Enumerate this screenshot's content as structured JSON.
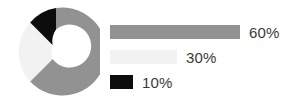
{
  "chart_data": {
    "type": "pie",
    "variant": "donut",
    "title": "",
    "subtitle": "",
    "xlabel": "",
    "ylabel": "",
    "grid": false,
    "legend_position": "right",
    "start_angle_deg": 0,
    "direction": "clockwise",
    "inner_radius_ratio": 0.52,
    "labels": [
      "60%",
      "30%",
      "10%"
    ],
    "values": [
      60,
      30,
      10
    ],
    "value_suffix": "%",
    "colors": [
      "#929292",
      "#f2f2f2",
      "#0d0d0d"
    ],
    "slices": [
      {
        "label": "60%",
        "value": 60,
        "color": "#929292",
        "legend_bar_width_px": 130
      },
      {
        "label": "30%",
        "value": 30,
        "color": "#f2f2f2",
        "legend_bar_width_px": 67
      },
      {
        "label": "10%",
        "value": 10,
        "color": "#0d0d0d",
        "legend_bar_width_px": 23
      }
    ],
    "annotations": []
  },
  "legend": {
    "items": [
      {
        "label": "60%"
      },
      {
        "label": "30%"
      },
      {
        "label": "10%"
      }
    ]
  },
  "colors": {
    "background": "#ffffff",
    "text": "#3a3a3a",
    "slice_primary": "#929292",
    "slice_secondary": "#f2f2f2",
    "slice_tertiary": "#0d0d0d"
  }
}
